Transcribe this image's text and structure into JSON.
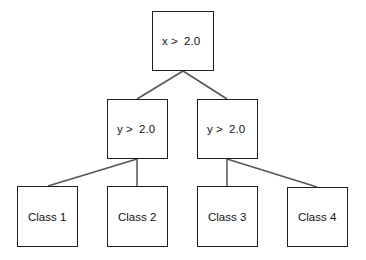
{
  "diagram": {
    "type": "decision-tree",
    "colors": {
      "box_border": "#1e1e1e",
      "edge": "#555555",
      "background": "#ffffff"
    },
    "nodes": [
      {
        "id": "root",
        "label": "x >  2.0",
        "x": 152,
        "y": 11,
        "w": 62,
        "h": 60
      },
      {
        "id": "left",
        "label": "y >  2.0",
        "x": 107,
        "y": 99,
        "w": 61,
        "h": 60
      },
      {
        "id": "right",
        "label": "y >  2.0",
        "x": 197,
        "y": 99,
        "w": 61,
        "h": 60
      },
      {
        "id": "c1",
        "label": "Class 1",
        "x": 17,
        "y": 186,
        "w": 61,
        "h": 61
      },
      {
        "id": "c2",
        "label": "Class 2",
        "x": 107,
        "y": 186,
        "w": 61,
        "h": 61
      },
      {
        "id": "c3",
        "label": "Class 3",
        "x": 197,
        "y": 186,
        "w": 61,
        "h": 61
      },
      {
        "id": "c4",
        "label": "Class 4",
        "x": 287,
        "y": 187,
        "w": 61,
        "h": 60
      }
    ],
    "edges": [
      {
        "from": "root",
        "to": "left",
        "x1": 183,
        "y1": 71,
        "x2": 137,
        "y2": 99
      },
      {
        "from": "root",
        "to": "right",
        "x1": 183,
        "y1": 71,
        "x2": 227,
        "y2": 99
      },
      {
        "from": "left",
        "to": "c1",
        "x1": 137,
        "y1": 159,
        "x2": 48,
        "y2": 186
      },
      {
        "from": "left",
        "to": "c2",
        "x1": 137,
        "y1": 159,
        "x2": 137,
        "y2": 186
      },
      {
        "from": "right",
        "to": "c3",
        "x1": 227,
        "y1": 159,
        "x2": 227,
        "y2": 186
      },
      {
        "from": "right",
        "to": "c4",
        "x1": 227,
        "y1": 159,
        "x2": 317,
        "y2": 187
      }
    ]
  }
}
